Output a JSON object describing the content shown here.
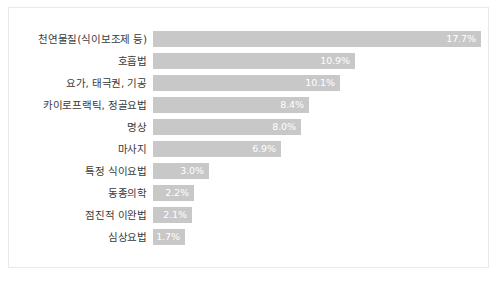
{
  "card": {
    "background_color": "#ffffff",
    "border_color": "#e9e9e9"
  },
  "chart_data": {
    "type": "bar",
    "orientation": "horizontal",
    "title": "",
    "subtitle": "",
    "xlabel": "",
    "ylabel": "",
    "grid": false,
    "legend": false,
    "axis_visible": false,
    "value_suffix": "%",
    "bar_color": "#c8c8c8",
    "value_label_color": "#ffffff",
    "category_label_color": "#3a3a3a",
    "xlim": [
      0,
      17.7
    ],
    "categories": [
      "천연물질(식이보조제 등)",
      "호흡법",
      "요가, 태극권, 기공",
      "카이로프랙틱, 정골요법",
      "명상",
      "마사지",
      "특정 식이요법",
      "동종의학",
      "점진적 이완법",
      "심상요법"
    ],
    "values": [
      17.7,
      10.9,
      10.1,
      8.4,
      8.0,
      6.9,
      3.0,
      2.2,
      2.1,
      1.7
    ],
    "value_labels": [
      "17.7%",
      "10.9%",
      "10.1%",
      "8.4%",
      "8.0%",
      "6.9%",
      "3.0%",
      "2.2%",
      "2.1%",
      "1.7%"
    ]
  }
}
